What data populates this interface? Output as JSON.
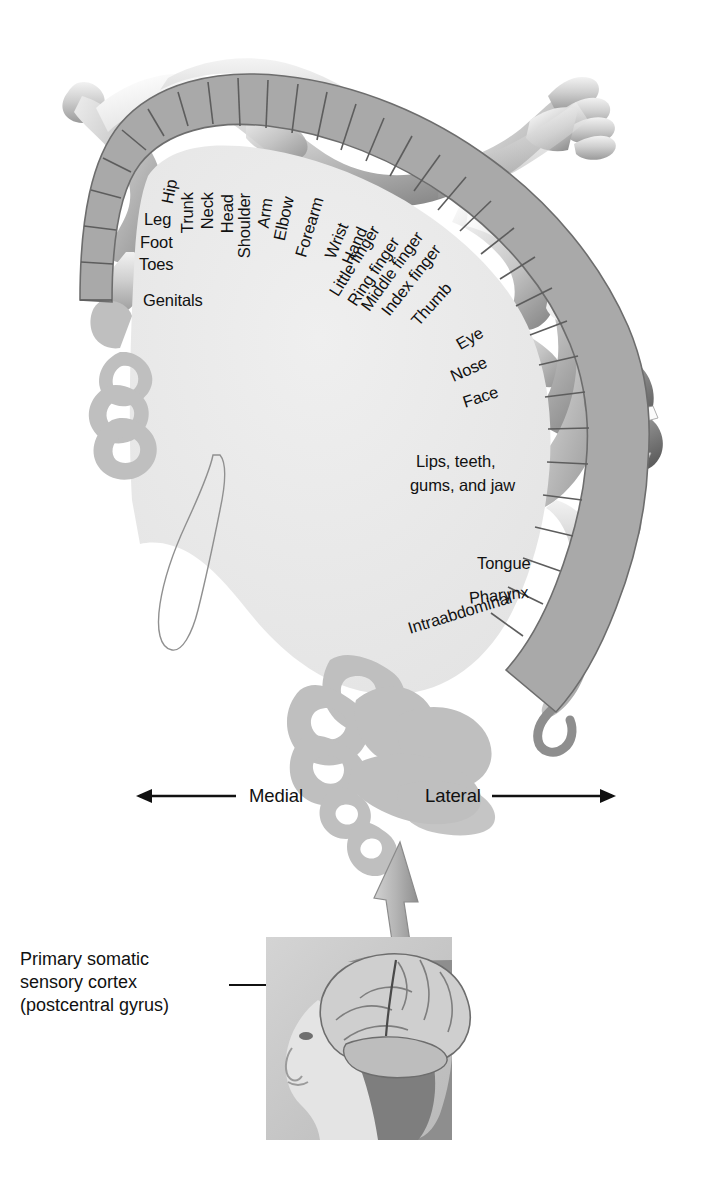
{
  "figure": {
    "type": "anatomical-diagram"
  },
  "colors": {
    "cortex_strip": "#a9a9a9",
    "strip_divider": "#5f5f5f",
    "interior": "#e9e9e9",
    "gyri": "#bdbdbd",
    "outline": "#7a7a7a",
    "text": "#111111",
    "arrow": "#b0b0b0",
    "photo_bg": "#c9c9c9"
  },
  "homunculus_labels": [
    {
      "id": "hip",
      "text": "Hip",
      "x": 176,
      "y": 196,
      "rot": -79,
      "size": "lbl-sm"
    },
    {
      "id": "leg",
      "text": "Leg",
      "x": 144,
      "y": 219,
      "rot": 0,
      "size": "lbl-sm"
    },
    {
      "id": "foot",
      "text": "Foot",
      "x": 140,
      "y": 242,
      "rot": 0,
      "size": "lbl-sm"
    },
    {
      "id": "toes",
      "text": "Toes",
      "x": 139,
      "y": 264,
      "rot": 0,
      "size": "lbl-sm"
    },
    {
      "id": "genitals",
      "text": "Genitals",
      "x": 143,
      "y": 300,
      "rot": 0,
      "size": "lbl-sm"
    },
    {
      "id": "trunk",
      "text": "Trunk",
      "x": 196,
      "y": 224,
      "rot": -90,
      "size": "lbl-sm"
    },
    {
      "id": "neck",
      "text": "Neck",
      "x": 216,
      "y": 220,
      "rot": -90,
      "size": "lbl-sm"
    },
    {
      "id": "head",
      "text": "Head",
      "x": 236,
      "y": 224,
      "rot": -90,
      "size": "lbl-sm"
    },
    {
      "id": "shoulder",
      "text": "Shoulder",
      "x": 253,
      "y": 249,
      "rot": -90,
      "size": "lbl-sm"
    },
    {
      "id": "arm",
      "text": "Arm",
      "x": 272,
      "y": 220,
      "rot": -82,
      "size": "lbl-sm"
    },
    {
      "id": "elbow",
      "text": "Elbow",
      "x": 288,
      "y": 233,
      "rot": -78,
      "size": "lbl-sm"
    },
    {
      "id": "forearm",
      "text": "Forearm",
      "x": 309,
      "y": 250,
      "rot": -73,
      "size": "lbl-sm"
    },
    {
      "id": "wrist",
      "text": "Wrist",
      "x": 338,
      "y": 252,
      "rot": -68,
      "size": "lbl-sm"
    },
    {
      "id": "hand",
      "text": "Hand",
      "x": 355,
      "y": 258,
      "rot": -66,
      "size": "lbl-sm"
    },
    {
      "id": "little-finger",
      "text": "Little finger",
      "x": 341,
      "y": 290,
      "rot": -58,
      "size": "lbl-sm"
    },
    {
      "id": "ring-finger",
      "text": "Ring finger",
      "x": 359,
      "y": 300,
      "rot": -56,
      "size": "lbl-sm"
    },
    {
      "id": "middle-finger",
      "text": "Middle finger",
      "x": 372,
      "y": 305,
      "rot": -54,
      "size": "lbl-sm"
    },
    {
      "id": "index-finger",
      "text": "Index finger",
      "x": 392,
      "y": 310,
      "rot": -52,
      "size": "lbl-sm"
    },
    {
      "id": "thumb",
      "text": "Thumb",
      "x": 421,
      "y": 320,
      "rot": -48,
      "size": "lbl-sm"
    },
    {
      "id": "eye",
      "text": "Eye",
      "x": 462,
      "y": 344,
      "rot": -30,
      "size": "lbl-sm"
    },
    {
      "id": "nose",
      "text": "Nose",
      "x": 455,
      "y": 376,
      "rot": -24,
      "size": "lbl-sm"
    },
    {
      "id": "face",
      "text": "Face",
      "x": 466,
      "y": 402,
      "rot": -18,
      "size": "lbl-sm"
    },
    {
      "id": "tongue",
      "text": "Tongue",
      "x": 477,
      "y": 563,
      "rot": 0,
      "size": "lbl-sm"
    },
    {
      "id": "pharynx",
      "text": "Pharynx",
      "x": 470,
      "y": 598,
      "rot": -6,
      "size": "lbl-sm"
    },
    {
      "id": "intraabdominal",
      "text": "Intraabdominal",
      "x": 411,
      "y": 628,
      "rot": -17,
      "size": "lbl-sm"
    }
  ],
  "homunculus_multiline": [
    {
      "id": "lips-teeth-gums-jaw",
      "line1": "Lips, teeth,",
      "line2": "gums, and jaw",
      "x": 416,
      "y": 452
    }
  ],
  "direction_labels": {
    "medial": "Medial",
    "lateral": "Lateral",
    "medial_x": 249,
    "medial_y": 802,
    "lateral_x": 425,
    "lateral_y": 802
  },
  "caption": {
    "line1": "Primary somatic",
    "line2": "sensory cortex",
    "line3": "(postcentral gyrus)",
    "x": 20,
    "y": 948
  },
  "icons": {
    "medial_arrow": "left-arrow-icon",
    "lateral_arrow": "right-arrow-icon",
    "callout_arrow": "up-arrow-icon",
    "leader_line": "leader-line-icon"
  },
  "photo": {
    "name": "head-brain-photo",
    "alt": "Lateral view of a woman's head with cerebral cortex exposed",
    "x": 266,
    "y": 937,
    "w": 186,
    "h": 203
  }
}
